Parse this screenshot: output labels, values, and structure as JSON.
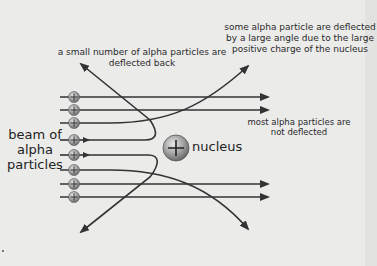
{
  "diagram": {
    "labels": {
      "deflected_back": "a small number of alpha particles are deflected back",
      "large_angle": "some alpha particle are deflected by a large angle due to the large positive charge of the nucleus",
      "not_deflected": "most alpha particles are not deflected",
      "beam": "beam of alpha particles",
      "nucleus": "nucleus"
    },
    "beam_lines": [
      {
        "y": 97,
        "path": "straight"
      },
      {
        "y": 110,
        "path": "straight"
      },
      {
        "y": 123,
        "path": "deflected-up-large-angle"
      },
      {
        "y": 140,
        "path": "deflected-back-up"
      },
      {
        "y": 155,
        "path": "deflected-back-down"
      },
      {
        "y": 170,
        "path": "deflected-down-large-angle"
      },
      {
        "y": 184,
        "path": "straight"
      },
      {
        "y": 197,
        "path": "straight"
      }
    ],
    "particle_symbol": "+",
    "nucleus_symbol": "+",
    "colors": {
      "line": "#333333",
      "particle": "#9a9a9a",
      "nucleus": "#a8a8a8",
      "background": "#ebebea"
    }
  }
}
